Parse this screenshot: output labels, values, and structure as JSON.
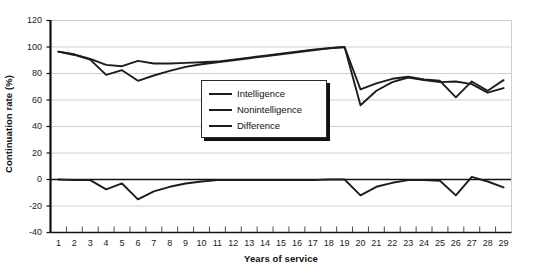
{
  "chart_data": {
    "type": "line",
    "title": "",
    "xlabel": "Years of service",
    "ylabel": "Continuation rate (%)",
    "xlim": [
      1,
      29
    ],
    "ylim": [
      -40,
      120
    ],
    "ytick_step": 20,
    "yticks": [
      120,
      100,
      80,
      60,
      40,
      20,
      0,
      -20,
      -40
    ],
    "grid": "horizontal",
    "legend_position": "inside-upper-middle",
    "x": [
      1,
      2,
      3,
      4,
      5,
      6,
      7,
      8,
      9,
      10,
      11,
      12,
      13,
      14,
      15,
      16,
      17,
      18,
      19,
      20,
      21,
      22,
      23,
      24,
      25,
      26,
      27,
      28,
      29
    ],
    "series": [
      {
        "name": "Intelligence",
        "color": "#1d1d1d",
        "values": [
          96.5,
          94.5,
          91.0,
          86.5,
          85.5,
          89.5,
          87.5,
          87.5,
          88.0,
          88.5,
          89.0,
          90.5,
          92.0,
          93.5,
          95.0,
          96.5,
          98.0,
          99.0,
          100.0,
          68.0,
          72.5,
          76.0,
          77.5,
          75.5,
          74.5,
          62.0,
          74.0,
          67.0,
          75.0
        ]
      },
      {
        "name": "Nonintelligence",
        "color": "#1d1d1d",
        "values": [
          96.5,
          94.0,
          90.5,
          79.0,
          82.5,
          74.5,
          78.5,
          82.0,
          85.0,
          87.0,
          88.5,
          90.0,
          91.5,
          93.0,
          94.5,
          96.0,
          97.5,
          99.0,
          100.0,
          56.0,
          67.0,
          73.5,
          77.0,
          75.0,
          73.5,
          74.0,
          72.0,
          65.5,
          69.0
        ]
      },
      {
        "name": "Difference",
        "color": "#1d1d1d",
        "values": [
          0.0,
          -0.5,
          -0.5,
          -7.5,
          -3.0,
          -15.0,
          -9.0,
          -5.5,
          -3.0,
          -1.5,
          -0.5,
          -0.5,
          -0.5,
          -0.5,
          -0.5,
          -0.5,
          -0.5,
          0.0,
          0.0,
          -12.0,
          -5.5,
          -2.5,
          -0.5,
          -0.5,
          -1.0,
          -12.0,
          2.0,
          -1.5,
          -6.0
        ]
      }
    ]
  },
  "legend": {
    "items": [
      {
        "label": "Intelligence"
      },
      {
        "label": "Nonintelligence"
      },
      {
        "label": "Difference"
      }
    ]
  }
}
